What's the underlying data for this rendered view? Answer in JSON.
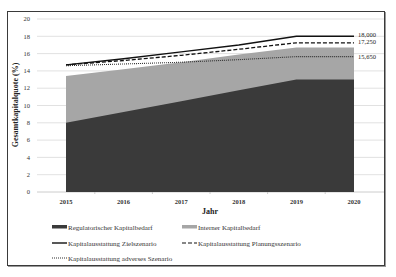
{
  "chart_data": {
    "type": "area",
    "title": "",
    "xlabel": "Jahr",
    "ylabel": "Gesamtkapitalquote (%)",
    "ylim": [
      0,
      20
    ],
    "yticks": [
      0,
      2,
      4,
      6,
      8,
      10,
      12,
      14,
      16,
      18,
      20
    ],
    "grid": true,
    "categories": [
      "2015",
      "2016",
      "2017",
      "2018",
      "2019",
      "2020"
    ],
    "areas": [
      {
        "name": "Regulatorischer Kapitalbedarf",
        "color": "#3a3a3a",
        "values": [
          8.0,
          9.25,
          10.5,
          11.75,
          13.0,
          13.0
        ]
      },
      {
        "name": "Interner Kapitalbedarf",
        "color": "#a6a6a6",
        "values": [
          13.4,
          14.2,
          15.0,
          15.9,
          16.7,
          16.7
        ]
      }
    ],
    "series": [
      {
        "name": "Kapitalausstattung Zielszenario",
        "style": "solid",
        "color": "#111111",
        "values": [
          14.7,
          15.4,
          16.2,
          17.0,
          18.0,
          18.0
        ],
        "end_label": "18,000"
      },
      {
        "name": "Kapitalausstattung Planungsszenario",
        "style": "dashed",
        "color": "#111111",
        "values": [
          14.7,
          15.2,
          15.8,
          16.5,
          17.25,
          17.25
        ],
        "end_label": "17,250"
      },
      {
        "name": "Kapitalausstattung adverses Szenario",
        "style": "dotted",
        "color": "#333333",
        "values": [
          14.6,
          14.8,
          15.0,
          15.3,
          15.65,
          15.65
        ],
        "end_label": "15,650"
      }
    ],
    "legend_position": "bottom"
  }
}
